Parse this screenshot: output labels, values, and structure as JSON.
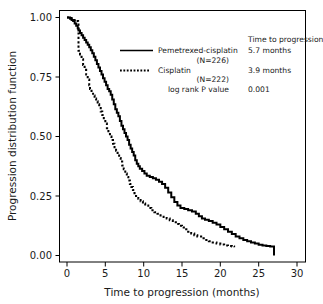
{
  "chart_data": {
    "type": "line",
    "title": "",
    "xlabel": "Time to progression (months)",
    "ylabel": "Progression distribution function",
    "xlim": [
      0,
      30
    ],
    "ylim": [
      0,
      1
    ],
    "xticks": [
      "0",
      "5",
      "10",
      "15",
      "20",
      "25",
      "30"
    ],
    "xtick_values": [
      0,
      5,
      10,
      15,
      20,
      25,
      30
    ],
    "yticks": [
      "0.00",
      "0.25",
      "0.50",
      "0.75",
      "1.00"
    ],
    "ytick_values": [
      0,
      0.25,
      0.5,
      0.75,
      1
    ],
    "grid": false,
    "legend_position": "upper-center",
    "series": [
      {
        "name": "Pemetrexed-cisplatin",
        "n_label": "(N=226)",
        "n": 226,
        "style": "solid",
        "color": "#000000",
        "median_time_to_progression": "5.7 months",
        "points": [
          [
            0.0,
            1.0
          ],
          [
            0.25,
            1.0
          ],
          [
            0.4,
            0.995
          ],
          [
            0.6,
            0.99
          ],
          [
            0.8,
            0.985
          ],
          [
            1.0,
            0.975
          ],
          [
            1.2,
            0.965
          ],
          [
            1.4,
            0.955
          ],
          [
            1.5,
            0.945
          ],
          [
            1.7,
            0.935
          ],
          [
            1.9,
            0.925
          ],
          [
            2.1,
            0.915
          ],
          [
            2.3,
            0.905
          ],
          [
            2.5,
            0.895
          ],
          [
            2.7,
            0.885
          ],
          [
            2.9,
            0.875
          ],
          [
            3.1,
            0.862
          ],
          [
            3.3,
            0.85
          ],
          [
            3.5,
            0.835
          ],
          [
            3.7,
            0.82
          ],
          [
            3.9,
            0.805
          ],
          [
            4.1,
            0.79
          ],
          [
            4.3,
            0.775
          ],
          [
            4.5,
            0.76
          ],
          [
            4.7,
            0.745
          ],
          [
            4.9,
            0.73
          ],
          [
            5.1,
            0.715
          ],
          [
            5.3,
            0.7
          ],
          [
            5.5,
            0.69
          ],
          [
            5.7,
            0.675
          ],
          [
            5.9,
            0.655
          ],
          [
            6.1,
            0.635
          ],
          [
            6.3,
            0.615
          ],
          [
            6.5,
            0.6
          ],
          [
            6.7,
            0.585
          ],
          [
            6.9,
            0.565
          ],
          [
            7.1,
            0.545
          ],
          [
            7.3,
            0.53
          ],
          [
            7.5,
            0.515
          ],
          [
            7.7,
            0.5
          ],
          [
            7.9,
            0.485
          ],
          [
            8.1,
            0.465
          ],
          [
            8.3,
            0.45
          ],
          [
            8.5,
            0.435
          ],
          [
            8.7,
            0.42
          ],
          [
            8.9,
            0.4
          ],
          [
            9.1,
            0.385
          ],
          [
            9.3,
            0.375
          ],
          [
            9.5,
            0.365
          ],
          [
            9.8,
            0.355
          ],
          [
            10.1,
            0.345
          ],
          [
            10.4,
            0.335
          ],
          [
            10.8,
            0.33
          ],
          [
            11.2,
            0.325
          ],
          [
            11.6,
            0.318
          ],
          [
            12.0,
            0.31
          ],
          [
            12.4,
            0.3
          ],
          [
            12.8,
            0.285
          ],
          [
            13.2,
            0.265
          ],
          [
            13.6,
            0.245
          ],
          [
            14.0,
            0.225
          ],
          [
            14.4,
            0.21
          ],
          [
            14.8,
            0.2
          ],
          [
            15.3,
            0.195
          ],
          [
            15.8,
            0.19
          ],
          [
            16.3,
            0.185
          ],
          [
            16.8,
            0.175
          ],
          [
            17.2,
            0.165
          ],
          [
            17.6,
            0.155
          ],
          [
            18.0,
            0.15
          ],
          [
            18.5,
            0.145
          ],
          [
            19.0,
            0.138
          ],
          [
            19.5,
            0.13
          ],
          [
            20.0,
            0.12
          ],
          [
            20.5,
            0.11
          ],
          [
            21.0,
            0.1
          ],
          [
            21.5,
            0.09
          ],
          [
            22.0,
            0.08
          ],
          [
            22.5,
            0.072
          ],
          [
            23.0,
            0.065
          ],
          [
            23.5,
            0.06
          ],
          [
            24.0,
            0.055
          ],
          [
            24.5,
            0.05
          ],
          [
            25.0,
            0.045
          ],
          [
            25.5,
            0.042
          ],
          [
            26.0,
            0.04
          ],
          [
            26.5,
            0.038
          ],
          [
            27.0,
            0.035
          ],
          [
            27.0,
            0.0
          ]
        ]
      },
      {
        "name": "Cisplatin",
        "n_label": "(N=222)",
        "n": 222,
        "style": "dotted",
        "color": "#000000",
        "median_time_to_progression": "3.9 months",
        "points": [
          [
            0.0,
            1.0
          ],
          [
            0.3,
            0.998
          ],
          [
            0.6,
            0.995
          ],
          [
            0.9,
            0.99
          ],
          [
            1.2,
            0.985
          ],
          [
            1.45,
            0.98
          ],
          [
            1.5,
            0.86
          ],
          [
            1.7,
            0.845
          ],
          [
            1.9,
            0.825
          ],
          [
            2.1,
            0.8
          ],
          [
            2.3,
            0.78
          ],
          [
            2.5,
            0.76
          ],
          [
            2.7,
            0.74
          ],
          [
            2.9,
            0.715
          ],
          [
            3.0,
            0.7
          ],
          [
            3.2,
            0.685
          ],
          [
            3.4,
            0.672
          ],
          [
            3.6,
            0.66
          ],
          [
            3.8,
            0.648
          ],
          [
            4.0,
            0.635
          ],
          [
            4.2,
            0.62
          ],
          [
            4.4,
            0.605
          ],
          [
            4.6,
            0.59
          ],
          [
            4.8,
            0.572
          ],
          [
            5.0,
            0.555
          ],
          [
            5.2,
            0.535
          ],
          [
            5.4,
            0.515
          ],
          [
            5.6,
            0.5
          ],
          [
            5.8,
            0.485
          ],
          [
            6.0,
            0.47
          ],
          [
            6.2,
            0.455
          ],
          [
            6.4,
            0.44
          ],
          [
            6.6,
            0.425
          ],
          [
            6.8,
            0.41
          ],
          [
            7.0,
            0.395
          ],
          [
            7.2,
            0.378
          ],
          [
            7.4,
            0.362
          ],
          [
            7.6,
            0.345
          ],
          [
            7.8,
            0.33
          ],
          [
            8.0,
            0.315
          ],
          [
            8.2,
            0.3
          ],
          [
            8.4,
            0.288
          ],
          [
            8.6,
            0.275
          ],
          [
            8.8,
            0.262
          ],
          [
            9.0,
            0.25
          ],
          [
            9.3,
            0.238
          ],
          [
            9.6,
            0.228
          ],
          [
            9.9,
            0.218
          ],
          [
            10.2,
            0.21
          ],
          [
            10.6,
            0.2
          ],
          [
            11.0,
            0.19
          ],
          [
            11.4,
            0.182
          ],
          [
            11.8,
            0.175
          ],
          [
            12.2,
            0.168
          ],
          [
            12.6,
            0.162
          ],
          [
            13.0,
            0.155
          ],
          [
            13.4,
            0.148
          ],
          [
            13.8,
            0.14
          ],
          [
            14.2,
            0.132
          ],
          [
            14.6,
            0.125
          ],
          [
            15.0,
            0.118
          ],
          [
            15.4,
            0.11
          ],
          [
            15.8,
            0.1
          ],
          [
            16.2,
            0.092
          ],
          [
            16.6,
            0.085
          ],
          [
            17.0,
            0.08
          ],
          [
            17.5,
            0.072
          ],
          [
            18.0,
            0.065
          ],
          [
            18.5,
            0.06
          ],
          [
            19.0,
            0.055
          ],
          [
            19.5,
            0.05
          ],
          [
            20.0,
            0.046
          ],
          [
            20.5,
            0.042
          ],
          [
            21.0,
            0.04
          ],
          [
            21.5,
            0.038
          ],
          [
            21.8,
            0.035
          ]
        ]
      }
    ],
    "annotations": {
      "column_header": "Time to progression",
      "log_rank_label": "log rank P value",
      "log_rank_p_value": "0.001"
    }
  },
  "legend": {
    "entries": [
      {
        "label": "Pemetrexed-cisplatin",
        "sub": "(N=226)",
        "value": "5.7 months",
        "style": "solid"
      },
      {
        "label": "Cisplatin",
        "sub": "(N=222)",
        "value": "3.9 months",
        "style": "dotted"
      }
    ],
    "header": "Time to progression",
    "footer_label": "log rank P value",
    "footer_value": "0.001"
  },
  "axes": {
    "x_title": "Time to progression (months)",
    "y_title": "Progression distribution function",
    "x_labels": [
      "0",
      "5",
      "10",
      "15",
      "20",
      "25",
      "30"
    ],
    "y_labels": [
      "1.00",
      "0.75",
      "0.50",
      "0.25",
      "0.00"
    ]
  },
  "colors": {
    "line": "#000000",
    "frame": "#000000",
    "background": "#ffffff",
    "text": "#1a1a1a"
  }
}
